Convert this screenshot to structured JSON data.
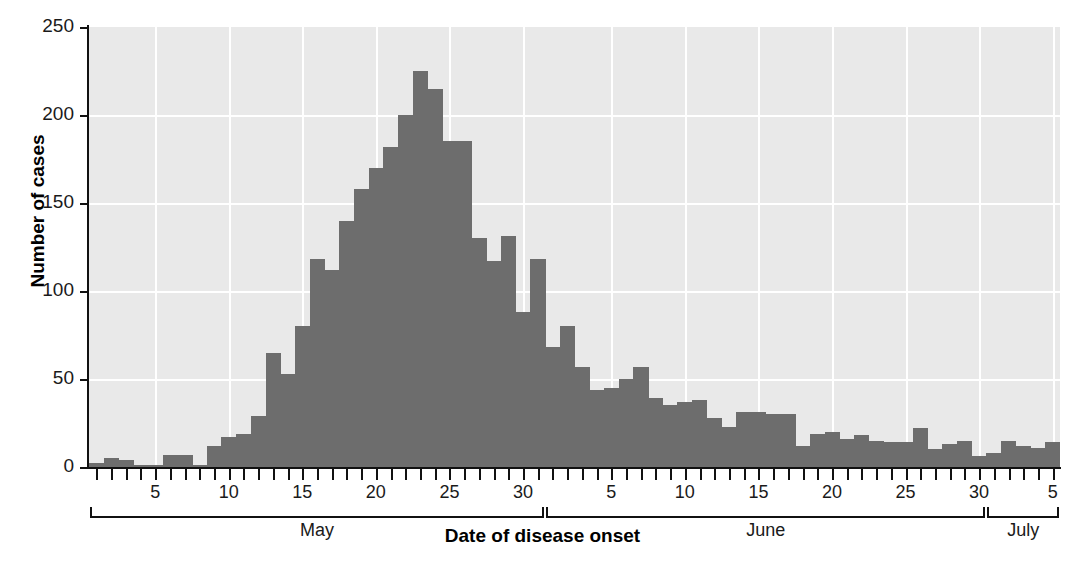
{
  "chart_data": {
    "type": "bar",
    "title": "",
    "subtitle": "",
    "xlabel": "Date of disease onset",
    "ylabel": "Number of cases",
    "ylim": [
      0,
      250
    ],
    "yticks": [
      0,
      50,
      100,
      150,
      200,
      250
    ],
    "grid": true,
    "legend": null,
    "bar_color": "#6d6d6d",
    "plot_background": "#e9e9e9",
    "gridline_color": "#ffffff",
    "axis_color": "#111111",
    "x_axis_groups": [
      {
        "name": "May",
        "ticks": [
          5,
          10,
          15,
          20,
          25,
          30
        ],
        "days": 31
      },
      {
        "name": "June",
        "ticks": [
          5,
          10,
          15,
          20,
          25,
          30
        ],
        "days": 30
      },
      {
        "name": "July",
        "ticks": [
          5
        ],
        "days": 5
      }
    ],
    "categories": [
      "May 1",
      "May 2",
      "May 3",
      "May 4",
      "May 5",
      "May 6",
      "May 7",
      "May 8",
      "May 9",
      "May 10",
      "May 11",
      "May 12",
      "May 13",
      "May 14",
      "May 15",
      "May 16",
      "May 17",
      "May 18",
      "May 19",
      "May 20",
      "May 21",
      "May 22",
      "May 23",
      "May 24",
      "May 25",
      "May 26",
      "May 27",
      "May 28",
      "May 29",
      "May 30",
      "May 31",
      "June 1",
      "June 2",
      "June 3",
      "June 4",
      "June 5",
      "June 6",
      "June 7",
      "June 8",
      "June 9",
      "June 10",
      "June 11",
      "June 12",
      "June 13",
      "June 14",
      "June 15",
      "June 16",
      "June 17",
      "June 18",
      "June 19",
      "June 20",
      "June 21",
      "June 22",
      "June 23",
      "June 24",
      "June 25",
      "June 26",
      "June 27",
      "June 28",
      "June 29",
      "June 30",
      "July 1",
      "July 2",
      "July 3",
      "July 4",
      "July 5"
    ],
    "values": [
      2,
      5,
      4,
      1,
      1,
      7,
      7,
      1,
      12,
      17,
      19,
      29,
      65,
      53,
      80,
      118,
      112,
      140,
      158,
      170,
      182,
      200,
      225,
      215,
      185,
      185,
      130,
      117,
      131,
      88,
      118,
      68,
      80,
      57,
      44,
      45,
      50,
      57,
      39,
      35,
      37,
      38,
      28,
      23,
      31,
      31,
      30,
      30,
      12,
      19,
      20,
      16,
      18,
      15,
      14,
      14,
      22,
      10,
      13,
      15,
      6,
      8,
      15,
      12,
      11,
      14
    ]
  }
}
